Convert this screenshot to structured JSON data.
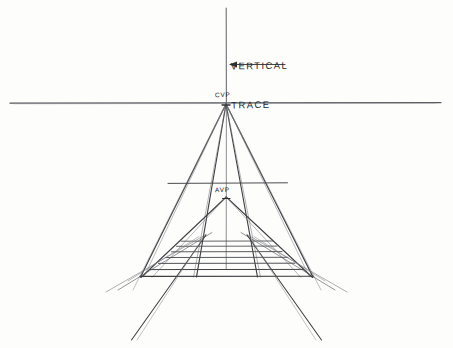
{
  "figure": {
    "background_color": "#fdfdfc",
    "ink_color": "#3a3a3a",
    "width": 453,
    "height": 348
  },
  "annotations": {
    "vertical_trace": {
      "line1": "VERTICAL",
      "line2": "TRACE",
      "arrow_direction": "left",
      "arrow_x_start": 285,
      "arrow_x_end": 229,
      "arrow_y": 64
    },
    "cvp": {
      "label": "CVP",
      "x": 226,
      "y": 103,
      "meaning": "central vanishing point"
    },
    "avp": {
      "label": "AVP",
      "x": 226,
      "y": 196,
      "meaning": "auxiliary vanishing point"
    }
  },
  "geometry": {
    "horizon_line": {
      "x1": 10,
      "x2": 441,
      "y": 103
    },
    "vertical_trace_line": {
      "x": 226,
      "y1": 8,
      "y2": 103
    },
    "center_axis_line": {
      "x": 226,
      "y1": 103,
      "y2": 268
    },
    "avp_crossbar": {
      "x1": 168,
      "x2": 287,
      "y": 183
    },
    "ladder_rungs": [
      {
        "y": 241,
        "x1": 180,
        "x2": 273
      },
      {
        "y": 246,
        "x1": 176,
        "x2": 277
      },
      {
        "y": 251,
        "x1": 171,
        "x2": 282
      },
      {
        "y": 257,
        "x1": 165,
        "x2": 288
      },
      {
        "y": 263,
        "x1": 158,
        "x2": 295
      },
      {
        "y": 269,
        "x1": 150,
        "x2": 303
      },
      {
        "y": 276,
        "x1": 140,
        "x2": 313
      }
    ],
    "cvp_rays": [
      {
        "to_x": 150,
        "to_y": 276
      },
      {
        "to_x": 313,
        "to_y": 276
      },
      {
        "to_x": 140,
        "to_y": 276
      },
      {
        "to_x": 120,
        "to_y": 290
      },
      {
        "to_x": 332,
        "to_y": 290
      },
      {
        "to_x": 196,
        "to_y": 276
      },
      {
        "to_x": 257,
        "to_y": 276
      }
    ],
    "avp_rays": [
      {
        "to_x": 141,
        "to_y": 277
      },
      {
        "to_x": 312,
        "to_y": 277
      },
      {
        "to_x": 160,
        "to_y": 278
      },
      {
        "to_x": 293,
        "to_y": 278
      }
    ],
    "measuring_diagonals_left": [
      {
        "x1": 211,
        "y1": 233,
        "x2": 120,
        "y2": 288
      },
      {
        "x1": 206,
        "y1": 235,
        "x2": 108,
        "y2": 290
      },
      {
        "x1": 133,
        "y1": 338,
        "x2": 205,
        "y2": 236
      }
    ],
    "measuring_diagonals_right": [
      {
        "x1": 242,
        "y1": 233,
        "x2": 333,
        "y2": 288
      },
      {
        "x1": 247,
        "y1": 235,
        "x2": 345,
        "y2": 290
      },
      {
        "x1": 320,
        "y1": 338,
        "x2": 248,
        "y2": 236
      }
    ]
  }
}
